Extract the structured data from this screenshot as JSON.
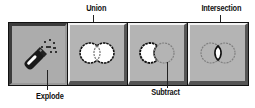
{
  "toolbar": {
    "buttons": [
      {
        "id": "explode",
        "label": "Explode",
        "icon": "explode-icon",
        "state": "pressed"
      },
      {
        "id": "union",
        "label": "Union",
        "icon": "union-icon",
        "state": "raised"
      },
      {
        "id": "subtract",
        "label": "Subtract",
        "icon": "subtract-icon",
        "state": "raised"
      },
      {
        "id": "intersection",
        "label": "Intersection",
        "icon": "intersection-icon",
        "state": "raised"
      }
    ]
  },
  "callouts": {
    "explode": "Explode",
    "union": "Union",
    "subtract": "Subtract",
    "intersection": "Intersection"
  },
  "colors": {
    "button_face": "#b4b4b4",
    "toolbar_border": "#111111",
    "highlight": "#f4f4f4",
    "shadow": "#555555"
  }
}
